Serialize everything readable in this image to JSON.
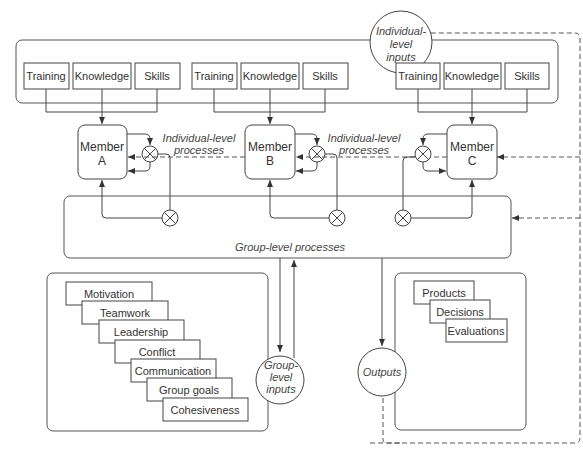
{
  "diagram": {
    "individual_inputs": {
      "circle_label": [
        "Individual-",
        "level",
        "inputs"
      ],
      "groups": [
        {
          "items": [
            "Training",
            "Knowledge",
            "Skills"
          ]
        },
        {
          "items": [
            "Training",
            "Knowledge",
            "Skills"
          ]
        },
        {
          "items": [
            "Training",
            "Knowledge",
            "Skills"
          ]
        }
      ]
    },
    "members": [
      {
        "line1": "Member",
        "line2": "A"
      },
      {
        "line1": "Member",
        "line2": "B"
      },
      {
        "line1": "Member",
        "line2": "C"
      }
    ],
    "individual_processes": [
      {
        "line1": "Individual-level",
        "line2": "processes"
      },
      {
        "line1": "Individual-level",
        "line2": "processes"
      }
    ],
    "group_processes_label": "Group-level processes",
    "group_inputs": {
      "circle_label": [
        "Group-",
        "level",
        "inputs"
      ],
      "items": [
        "Motivation",
        "Teamwork",
        "Leadership",
        "Conflict",
        "Communication",
        "Group goals",
        "Cohesiveness"
      ]
    },
    "outputs": {
      "circle_label": "Outputs",
      "items": [
        "Products",
        "Decisions",
        "Evaluations"
      ]
    }
  }
}
